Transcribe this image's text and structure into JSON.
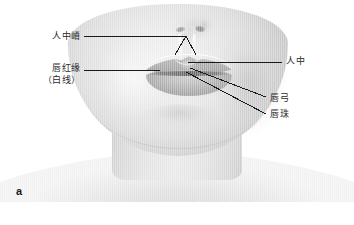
{
  "figure": {
    "panel_letter": "a"
  },
  "labels": {
    "philtral_ridge": "人中嵴",
    "vermilion_border": "唇红缘",
    "vermilion_border_sub": "（白线）",
    "philtrum": "人中",
    "cupids_bow": "唇弓",
    "tubercle": "唇珠"
  },
  "colors": {
    "background": "#ffffff",
    "leader_line": "#1a1a1a",
    "label_text": "#2a2a2a",
    "skin_light": "#efefef",
    "skin_mid": "#dcdcdc",
    "skin_dark": "#c9c9c9",
    "lip": "#b0b0b0"
  }
}
